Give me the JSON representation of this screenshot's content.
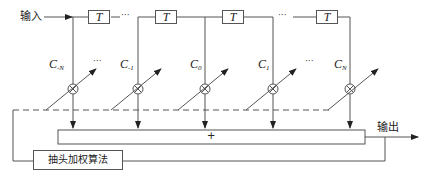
{
  "diagram": {
    "input_label": "输入",
    "output_label": "输出",
    "delay_label": "T",
    "sum_label": "+",
    "algorithm_label": "抽头加权算法",
    "ellipsis": "···",
    "taps": [
      {
        "c": "C",
        "sub": "-N"
      },
      {
        "c": "C",
        "sub": "-1"
      },
      {
        "c": "C",
        "sub": "0"
      },
      {
        "c": "C",
        "sub": "1"
      },
      {
        "c": "C",
        "sub": "N"
      }
    ]
  }
}
